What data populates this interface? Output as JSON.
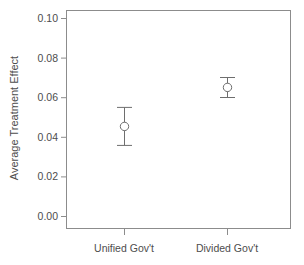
{
  "chart_data": {
    "type": "scatter",
    "title": "",
    "xlabel": "",
    "ylabel": "Average Treatment Effect",
    "categories": [
      "Unified Gov't",
      "Divided Gov't"
    ],
    "values": [
      0.0455,
      0.0652
    ],
    "error_low": [
      0.0359,
      0.0601
    ],
    "error_high": [
      0.0551,
      0.0702
    ],
    "ylim": [
      0.0,
      0.105
    ],
    "yticks": [
      0.0,
      0.02,
      0.04,
      0.06,
      0.08,
      0.1
    ],
    "ytick_labels": [
      "0.00",
      "0.02",
      "0.04",
      "0.06",
      "0.08",
      "0.10"
    ],
    "xticks": [
      1,
      2
    ],
    "grid": false,
    "legend": "none",
    "marker": "open-circle",
    "series": [
      {
        "name": "Average Treatment Effect",
        "points": [
          {
            "category": "Unified Gov't",
            "value": 0.0455,
            "ci_low": 0.0359,
            "ci_high": 0.0551
          },
          {
            "category": "Divided Gov't",
            "value": 0.0652,
            "ci_low": 0.0601,
            "ci_high": 0.0702
          }
        ]
      }
    ]
  },
  "axis": {
    "y_title": "Average Treatment Effect",
    "y_tick_labels": [
      "0.10",
      "0.08",
      "0.06",
      "0.04",
      "0.02",
      "0.00"
    ],
    "x_tick_labels": [
      "Unified Gov't",
      "Divided Gov't"
    ]
  },
  "colors": {
    "axis": "#808080",
    "marker_edge": "#6e6e6e",
    "error_bar": "#6e6e6e",
    "text": "#4d4d4d",
    "background": "#ffffff"
  }
}
